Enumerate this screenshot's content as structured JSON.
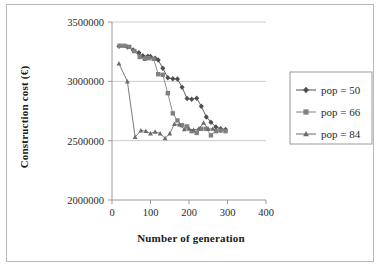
{
  "chart_data": {
    "type": "line",
    "title": "",
    "xlabel": "Number of generation",
    "ylabel": "Construction cost (€)",
    "xlim": [
      0,
      400
    ],
    "ylim": [
      2000000,
      3500000
    ],
    "xticks": [
      0,
      100,
      200,
      300,
      400
    ],
    "yticks": [
      2000000,
      2500000,
      3000000,
      3500000
    ],
    "xtick_labels": [
      "0",
      "100",
      "200",
      "300",
      "400"
    ],
    "ytick_labels": [
      "2000000",
      "2500000",
      "3000000",
      "3500000"
    ],
    "grid": "horizontal",
    "legend_position": "right-outside",
    "series": [
      {
        "name": "pop = 50",
        "marker": "diamond",
        "color": "#4f4f4f",
        "x": [
          18,
          40,
          55,
          70,
          80,
          93,
          100,
          112,
          120,
          132,
          145,
          158,
          170,
          182,
          195,
          207,
          220,
          232,
          245,
          257,
          270,
          282,
          295
        ],
        "y": [
          3295000,
          3290000,
          3265000,
          3240000,
          3215000,
          3212000,
          3210000,
          3195000,
          3180000,
          3110000,
          3030000,
          3022000,
          3020000,
          2950000,
          2855000,
          2850000,
          2858000,
          2790000,
          2700000,
          2655000,
          2615000,
          2600000,
          2595000
        ]
      },
      {
        "name": "pop = 66",
        "marker": "square",
        "color": "#808080",
        "x": [
          20,
          32,
          45,
          58,
          72,
          85,
          95,
          108,
          120,
          132,
          145,
          158,
          170,
          182,
          195,
          207,
          220,
          232,
          245,
          257,
          270,
          282,
          295
        ],
        "y": [
          3300000,
          3300000,
          3290000,
          3255000,
          3205000,
          3190000,
          3195000,
          3190000,
          3060000,
          3055000,
          2900000,
          2730000,
          2670000,
          2630000,
          2620000,
          2580000,
          2565000,
          2600000,
          2600000,
          2545000,
          2580000,
          2585000,
          2580000
        ]
      },
      {
        "name": "pop = 84",
        "marker": "triangle",
        "color": "#6b6b6b",
        "x": [
          18,
          40,
          60,
          75,
          88,
          100,
          112,
          125,
          138,
          150,
          162,
          175,
          188,
          200,
          212,
          225,
          238,
          250,
          262
        ],
        "y": [
          3150000,
          2998000,
          2530000,
          2585000,
          2580000,
          2560000,
          2575000,
          2560000,
          2520000,
          2560000,
          2640000,
          2635000,
          2595000,
          2600000,
          2590000,
          2600000,
          2650000,
          2598000,
          2600000
        ]
      }
    ]
  },
  "legend": {
    "items": [
      {
        "label": "pop = 50",
        "marker": "diamond"
      },
      {
        "label": "pop = 66",
        "marker": "square"
      },
      {
        "label": "pop = 84",
        "marker": "triangle"
      }
    ]
  },
  "colors": {
    "series_1": "#4f4f4f",
    "series_2": "#808080",
    "series_3": "#6b6b6b",
    "axis": "#9a9a9a",
    "grid": "#cccccc",
    "text": "#1a1a1a",
    "frame": "#b9b9b9"
  }
}
